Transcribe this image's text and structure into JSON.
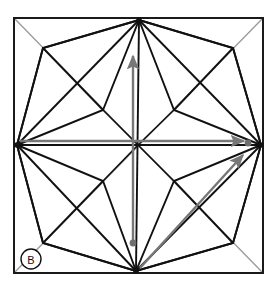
{
  "figure": {
    "panel_label": "B",
    "canvas": {
      "width": 275,
      "height": 290
    },
    "colors": {
      "background": "#ffffff",
      "frame": "#1a1a1a",
      "construction_line": "#111111",
      "guide_line": "#9a9a9a",
      "arrow": "#777777",
      "marker_dot": "#6e6e6e",
      "label": "#111111"
    },
    "frame": {
      "name": "bounding-square",
      "left": 14,
      "top": 18,
      "right": 263,
      "bottom": 273,
      "stroke_width": 2
    },
    "key_points": {
      "top": [
        139,
        20
      ],
      "bottom": [
        136,
        271
      ],
      "left": [
        17,
        145
      ],
      "right": [
        261,
        145
      ],
      "center": [
        138,
        145
      ]
    },
    "guide_diagonals": [
      {
        "name": "diagonal-tl-br",
        "from": [
          14,
          18
        ],
        "to": [
          263,
          273
        ]
      },
      {
        "name": "diagonal-bl-tr",
        "from": [
          14,
          273
        ],
        "to": [
          263,
          18
        ]
      }
    ],
    "guide_cross": [
      {
        "name": "cross-horizontal",
        "from": [
          17,
          145
        ],
        "to": [
          261,
          145
        ]
      },
      {
        "name": "cross-vertical",
        "from": [
          139,
          20
        ],
        "to": [
          136,
          271
        ]
      }
    ],
    "quadrants": [
      {
        "name": "kite-top-left",
        "outer_vertex": [
          43,
          48
        ],
        "inner_vertex": [
          103,
          110
        ],
        "side_a": [
          17,
          145
        ],
        "side_b": [
          139,
          20
        ]
      },
      {
        "name": "kite-top-right",
        "outer_vertex": [
          233,
          48
        ],
        "inner_vertex": [
          174,
          110
        ],
        "side_a": [
          261,
          145
        ],
        "side_b": [
          139,
          20
        ]
      },
      {
        "name": "kite-bottom-left",
        "outer_vertex": [
          43,
          243
        ],
        "inner_vertex": [
          103,
          181
        ],
        "side_a": [
          17,
          145
        ],
        "side_b": [
          136,
          271
        ]
      },
      {
        "name": "kite-bottom-right",
        "outer_vertex": [
          233,
          243
        ],
        "inner_vertex": [
          174,
          181
        ],
        "side_a": [
          261,
          145
        ],
        "side_b": [
          136,
          271
        ]
      }
    ],
    "arrows": [
      {
        "name": "arrow-vertical-up",
        "from": [
          133,
          243
        ],
        "to": [
          133,
          53
        ],
        "direction": "up",
        "has_tail_dot": true
      },
      {
        "name": "arrow-horizontal-right",
        "from": [
          20,
          141
        ],
        "to": [
          247,
          141
        ],
        "direction": "right",
        "has_tail_dot": false
      },
      {
        "name": "arrow-diagonal-up-right",
        "from": [
          140,
          268
        ],
        "to": [
          246,
          152
        ],
        "direction": "up-right",
        "has_tail_dot": false
      }
    ],
    "vertex_dots": [
      {
        "name": "dot-right-vertex",
        "at": [
          248,
          143
        ],
        "r": 3.4
      },
      {
        "name": "dot-vertical-arrow-tail",
        "at": [
          133,
          243
        ],
        "r": 3.4
      }
    ],
    "label_badge": {
      "name": "panel-label-badge",
      "cx": 31,
      "cy": 259,
      "r": 10,
      "text": "B"
    }
  }
}
